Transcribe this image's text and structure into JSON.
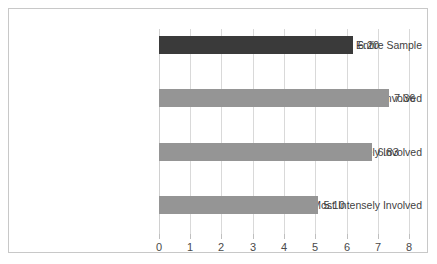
{
  "chart_data": {
    "type": "bar",
    "orientation": "horizontal",
    "title": "",
    "subtitle": "",
    "xlabel": "",
    "ylabel": "",
    "xlim": [
      0,
      8
    ],
    "grid": true,
    "legend": false,
    "categories": [
      "Entire Sample",
      "Least Intensely Involved",
      "Moderately Intensely Involved",
      "Most Intensely Involved"
    ],
    "values": [
      6.2,
      6.83,
      7.36,
      5.1
    ],
    "series": [
      {
        "name": "Mean Score",
        "values": [
          6.2,
          7.36,
          6.83,
          5.1
        ]
      }
    ],
    "bars": [
      {
        "category": "Entire Sample",
        "value": 6.2,
        "label": "6.20",
        "color": "#3a3a3a"
      },
      {
        "category": "Least Intensely Involved",
        "value": 7.36,
        "label": "7.36",
        "color": "#959595"
      },
      {
        "category": "Moderately Intensely Involved",
        "value": 6.83,
        "label": "6.83",
        "color": "#959595"
      },
      {
        "category": "Most Intensely Involved",
        "value": 5.1,
        "label": "5.10",
        "color": "#959595"
      }
    ],
    "xticks": [
      0,
      1,
      2,
      3,
      4,
      5,
      6,
      7,
      8
    ],
    "xticklabels": [
      "0",
      "1",
      "2",
      "3",
      "4",
      "5",
      "6",
      "7",
      "8"
    ],
    "colors": {
      "highlight_bar": "#3a3a3a",
      "standard_bar": "#959595",
      "gridline": "#d9d9d9",
      "frame_border": "#c8c8c8",
      "text": "#3f3f3f",
      "background": "#ffffff"
    }
  }
}
